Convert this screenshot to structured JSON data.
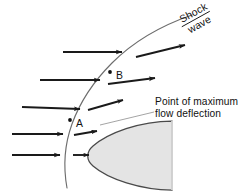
{
  "figure": {
    "kind": "schematic-diagram",
    "background_color": "#ffffff"
  },
  "labels": {
    "shock_wave_line1": "Shock",
    "shock_wave_line2": "wave",
    "callout_line1": "Point of maximum",
    "callout_line2": "flow deflection",
    "point_a": "A",
    "point_b": "B"
  },
  "colors": {
    "ink": "#111111",
    "shock_curve": "#6d6d6d",
    "body_outline": "#4a4a4a",
    "body_fill": "#e4e4e4",
    "leader_line": "#9a9a9a",
    "arrow": "#1a1a1a"
  },
  "geometry": {
    "shock_curve_path": "M 67,188 C 63,166 64,146 72,124 C 80,102 93,82 112,63 C 133,42 160,26 192,15",
    "body_path": "M 172,121 C 140,121 108,133 93,146 C 86,152 86,160 93,166 C 108,179 141,190 172,190 Z",
    "leader_line": {
      "x1": 100,
      "y1": 125,
      "x2": 154,
      "y2": 112
    },
    "point_a_marker": {
      "cx": 70,
      "cy": 120,
      "r": 1.9
    },
    "point_b_marker": {
      "cx": 110,
      "cy": 72,
      "r": 1.9
    },
    "shock_label_rotation_deg": -29
  },
  "streamlines": [
    {
      "id": "row-1",
      "incoming": {
        "x1": 63,
        "y1": 52,
        "x2": 122,
        "y2": 52
      },
      "deflected": {
        "x1": 136,
        "y1": 57,
        "x2": 185,
        "y2": 45
      }
    },
    {
      "id": "row-2",
      "incoming": {
        "x1": 40,
        "y1": 80,
        "x2": 100,
        "y2": 80
      },
      "deflected": {
        "x1": 108,
        "y1": 84,
        "x2": 155,
        "y2": 78
      }
    },
    {
      "id": "row-3",
      "incoming": {
        "x1": 22,
        "y1": 107,
        "x2": 80,
        "y2": 109
      },
      "deflected": {
        "x1": 88,
        "y1": 110,
        "x2": 123,
        "y2": 100
      }
    },
    {
      "id": "row-4",
      "incoming": {
        "x1": 12,
        "y1": 134,
        "x2": 63,
        "y2": 134
      },
      "deflected": {
        "x1": 74,
        "y1": 135,
        "x2": 97,
        "y2": 131
      }
    },
    {
      "id": "row-5",
      "incoming": {
        "x1": 12,
        "y1": 155,
        "x2": 60,
        "y2": 155
      },
      "deflected": {
        "x1": 73,
        "y1": 155,
        "x2": 89,
        "y2": 155
      }
    }
  ]
}
